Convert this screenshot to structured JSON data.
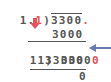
{
  "top_problem": {
    "divisor_prefix": "1.",
    "divisor_red_digit": "1",
    "bracket": ")",
    "dividend": "3300",
    "dividend_red_point": "."
  },
  "quotient": "3000",
  "scaled_problem": {
    "divisor": "11",
    "bracket": ")",
    "dividend_main": "3300",
    "dividend_red_zero": "0"
  },
  "product": "33000",
  "remainder": "0",
  "colors": {
    "text": "#555555",
    "highlight": "#e8505b",
    "pointer_arrow": "#6b78b4"
  },
  "icons": {
    "down_arrow": "arrow-down-icon",
    "left_arrow": "arrow-left-icon"
  }
}
